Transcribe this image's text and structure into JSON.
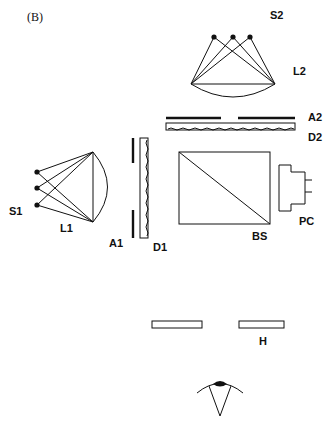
{
  "figure": {
    "panel_label": "(B)",
    "labels": {
      "s2": "S2",
      "l2": "L2",
      "a2": "A2",
      "d2": "D2",
      "s1": "S1",
      "l1": "L1",
      "a1": "A1",
      "d1": "D1",
      "bs": "BS",
      "pc": "PC",
      "h": "H"
    },
    "colors": {
      "ink": "#111111",
      "background": "#ffffff"
    }
  }
}
